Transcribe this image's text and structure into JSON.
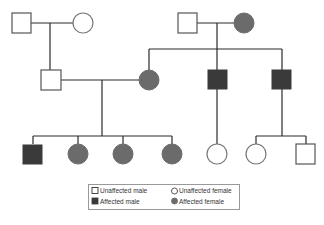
{
  "colors": {
    "line": "#2a2a2a",
    "outline": "#555555",
    "affected_male": "#3a3a3a",
    "affected_female": "#6b6b6b",
    "unaffected_fill": "#ffffff",
    "legend_border": "#999999"
  },
  "diagram": {
    "type": "pedigree",
    "generations": [
      {
        "label": "I",
        "individuals": [
          {
            "id": "I-1",
            "sex": "male",
            "affected": false
          },
          {
            "id": "I-2",
            "sex": "female",
            "affected": false
          },
          {
            "id": "I-3",
            "sex": "male",
            "affected": false
          },
          {
            "id": "I-4",
            "sex": "female",
            "affected": true
          }
        ]
      },
      {
        "label": "II",
        "individuals": [
          {
            "id": "II-1",
            "sex": "male",
            "affected": false,
            "parents": [
              "I-1",
              "I-2"
            ]
          },
          {
            "id": "II-2",
            "sex": "female",
            "affected": true,
            "parents": [
              "I-3",
              "I-4"
            ]
          },
          {
            "id": "II-3",
            "sex": "male",
            "affected": true,
            "parents": [
              "I-3",
              "I-4"
            ]
          },
          {
            "id": "II-4",
            "sex": "male",
            "affected": true,
            "parents": [
              "I-3",
              "I-4"
            ]
          }
        ]
      },
      {
        "label": "III",
        "individuals": [
          {
            "id": "III-1",
            "sex": "male",
            "affected": true,
            "parents": [
              "II-1",
              "II-2"
            ]
          },
          {
            "id": "III-2",
            "sex": "female",
            "affected": true,
            "parents": [
              "II-1",
              "II-2"
            ]
          },
          {
            "id": "III-3",
            "sex": "female",
            "affected": true,
            "parents": [
              "II-1",
              "II-2"
            ]
          },
          {
            "id": "III-4",
            "sex": "female",
            "affected": true,
            "parents": [
              "II-1",
              "II-2"
            ]
          },
          {
            "id": "III-5",
            "sex": "female",
            "affected": false,
            "parents": [
              "II-3"
            ]
          },
          {
            "id": "III-6",
            "sex": "female",
            "affected": false,
            "parents": [
              "II-4"
            ]
          },
          {
            "id": "III-7",
            "sex": "male",
            "affected": false,
            "parents": [
              "II-4"
            ]
          }
        ]
      }
    ]
  },
  "legend": {
    "items": [
      {
        "label": "Unaffected male",
        "symbol": "open-square"
      },
      {
        "label": "Unaffected female",
        "symbol": "open-circle"
      },
      {
        "label": "Affected male",
        "symbol": "filled-square"
      },
      {
        "label": "Affected female",
        "symbol": "filled-circle"
      }
    ]
  }
}
